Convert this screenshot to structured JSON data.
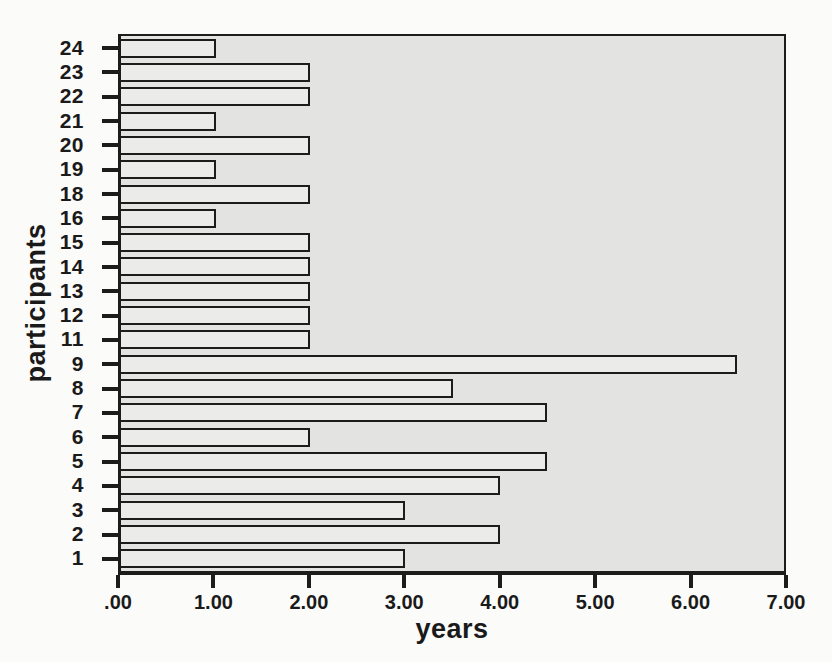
{
  "chart_data": {
    "type": "bar",
    "orientation": "horizontal",
    "title": "",
    "xlabel": "years",
    "ylabel": "participants",
    "categories": [
      "24",
      "23",
      "22",
      "21",
      "20",
      "19",
      "18",
      "16",
      "15",
      "14",
      "13",
      "12",
      "11",
      "9",
      "8",
      "7",
      "6",
      "5",
      "4",
      "3",
      "2",
      "1"
    ],
    "values": [
      1.0,
      2.0,
      2.0,
      1.0,
      2.0,
      1.0,
      2.0,
      1.0,
      2.0,
      2.0,
      2.0,
      2.0,
      2.0,
      6.5,
      3.5,
      4.5,
      2.0,
      4.5,
      4.0,
      3.0,
      4.0,
      3.0
    ],
    "xlim": [
      0,
      7
    ],
    "x_tick_labels": [
      ".00",
      "1.00",
      "2.00",
      "3.00",
      "4.00",
      "5.00",
      "6.00",
      "7.00"
    ],
    "x_tick_values": [
      0,
      1,
      2,
      3,
      4,
      5,
      6,
      7
    ],
    "grid": false,
    "legend": null,
    "colors": {
      "page_bg": "#fbfbfa",
      "plot_bg": "#e3e3e1",
      "bar_fill": "#ebebe9",
      "bar_border": "#1c1c1c",
      "axis": "#1c1c1c",
      "text": "#1a1a1a"
    }
  }
}
